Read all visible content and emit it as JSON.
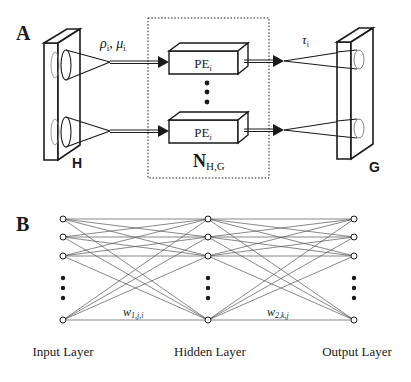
{
  "panel_a": {
    "label": "A",
    "input_sheet_label": "H",
    "output_sheet_label": "G",
    "input_params": "ρi, μi",
    "input_params_rho": "ρ",
    "input_params_rho_sub": "i",
    "input_params_sep": ", ",
    "input_params_mu": "μ",
    "input_params_mu_sub": "i",
    "output_param": "τ",
    "output_param_sub": "i",
    "processing_elements": [
      {
        "label": "PE",
        "sub": "i"
      },
      {
        "label": "PE",
        "sub": "i"
      }
    ],
    "network_label": "N",
    "network_sub": "H,G"
  },
  "panel_b": {
    "label": "B",
    "layers": [
      {
        "name": "Input Layer"
      },
      {
        "name": "Hidden Layer"
      },
      {
        "name": "Output Layer"
      }
    ],
    "weights": [
      {
        "symbol": "w",
        "sub": "1,j,i"
      },
      {
        "symbol": "w",
        "sub": "2,k,j"
      }
    ]
  },
  "colors": {
    "stroke": "#1a1a1a",
    "background": "#ffffff",
    "thin_stroke": "#555555"
  }
}
